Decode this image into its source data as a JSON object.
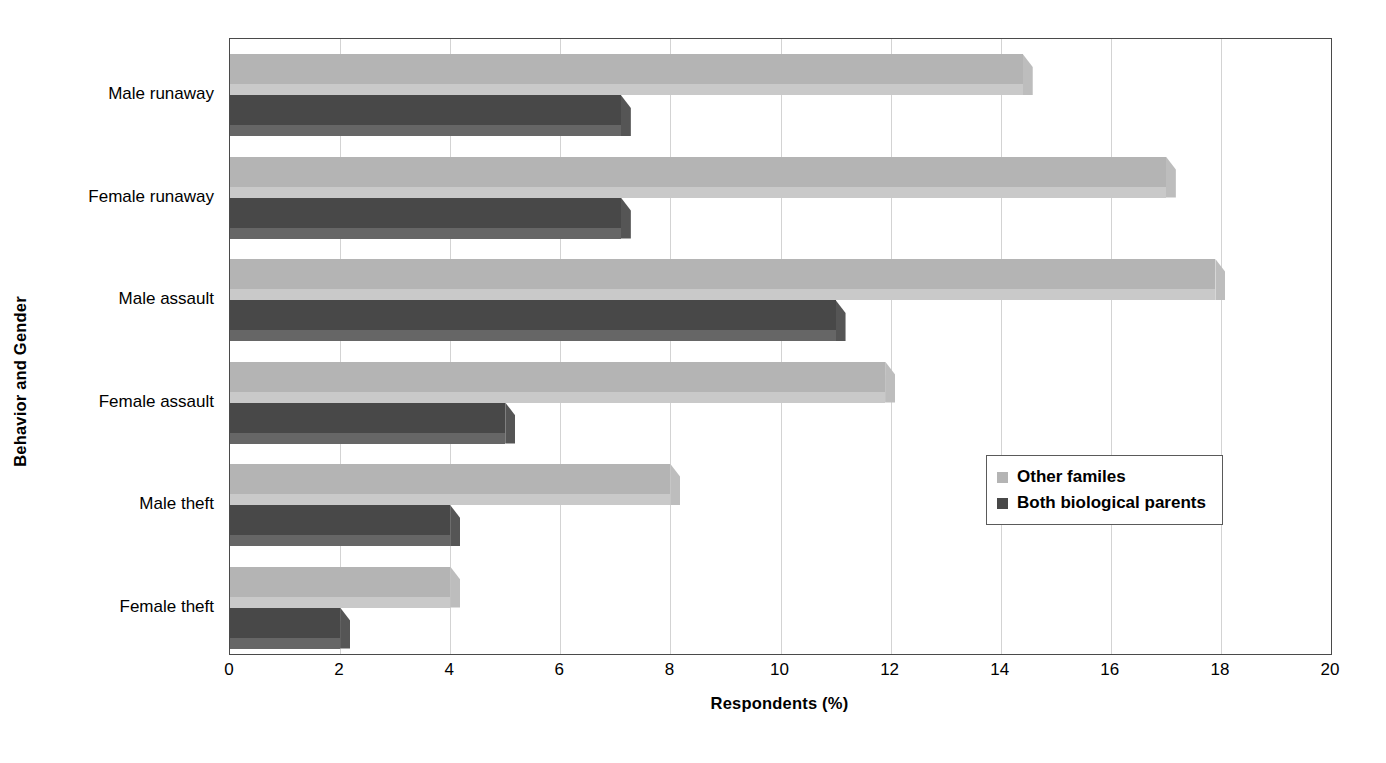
{
  "chart_data": {
    "type": "bar",
    "orientation": "horizontal",
    "title": "",
    "xlabel": "Respondents (%)",
    "ylabel": "Behavior and Gender",
    "xlim": [
      0,
      20
    ],
    "xticks": [
      0,
      2,
      4,
      6,
      8,
      10,
      12,
      14,
      16,
      18,
      20
    ],
    "xtick_labels": [
      "0",
      "2",
      "4",
      "6",
      "8",
      "10",
      "12",
      "14",
      "16",
      "18",
      "20"
    ],
    "grid": "vertical",
    "legend_position": "middle-right",
    "categories": [
      "Male runaway",
      "Female runaway",
      "Male assault",
      "Female assault",
      "Male theft",
      "Female theft"
    ],
    "series": [
      {
        "name": "Other familes",
        "color": "#b4b4b4",
        "values": [
          14.4,
          17.0,
          17.9,
          11.9,
          8.0,
          4.0
        ]
      },
      {
        "name": "Both biological parents",
        "color": "#484848",
        "values": [
          7.1,
          7.1,
          11.0,
          5.0,
          4.0,
          2.0
        ]
      }
    ]
  },
  "legend": {
    "entries": [
      {
        "label": "Other familes",
        "swatch": "light"
      },
      {
        "label": "Both biological parents",
        "swatch": "dark"
      }
    ]
  }
}
